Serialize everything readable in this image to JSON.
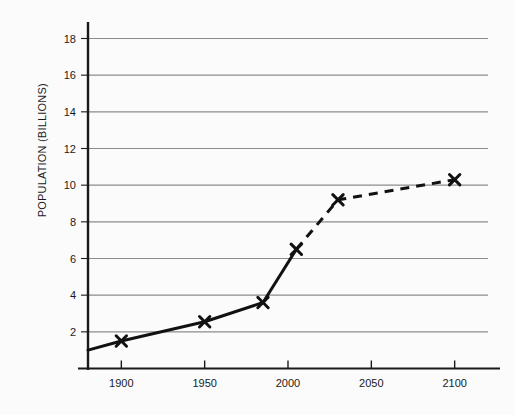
{
  "chart_data": {
    "type": "line",
    "title": "",
    "subtitle": "",
    "xlabel": "",
    "ylabel": "POPULATION (BILLIONS)",
    "xlim": [
      1880,
      2120
    ],
    "ylim": [
      0,
      18.9
    ],
    "grid": "horizontal",
    "legend": "none",
    "x_ticks": [
      1900,
      1950,
      2000,
      2050,
      2100
    ],
    "x_tick_labels": [
      "1900",
      "1950",
      "2000",
      "2050",
      "2100"
    ],
    "y_ticks": [
      2,
      4,
      6,
      8,
      10,
      12,
      14,
      16,
      18
    ],
    "y_tick_labels": [
      "2",
      "4",
      "6",
      "8",
      "10",
      "12",
      "14",
      "16",
      "18"
    ],
    "series": [
      {
        "name": "Historical population",
        "style": "solid",
        "color": "#111111",
        "marker": "x",
        "points": [
          {
            "x": 1880,
            "y": 1.0,
            "marker": false
          },
          {
            "x": 1900,
            "y": 1.5,
            "marker": true
          },
          {
            "x": 1950,
            "y": 2.55,
            "marker": true
          },
          {
            "x": 1985,
            "y": 3.6,
            "marker": true
          },
          {
            "x": 2005,
            "y": 6.5,
            "marker": true
          }
        ]
      },
      {
        "name": "Projected population",
        "style": "dashed",
        "color": "#111111",
        "marker": "x",
        "points": [
          {
            "x": 2005,
            "y": 6.5,
            "marker": false
          },
          {
            "x": 2030,
            "y": 9.2,
            "marker": true
          },
          {
            "x": 2100,
            "y": 10.3,
            "marker": true
          }
        ]
      }
    ]
  },
  "colors": {
    "background": "#fbfbfb",
    "axis": "#1a1a1a",
    "gridline": "#8c8c8c",
    "data_line": "#111111",
    "text": "#1a1a1a"
  }
}
